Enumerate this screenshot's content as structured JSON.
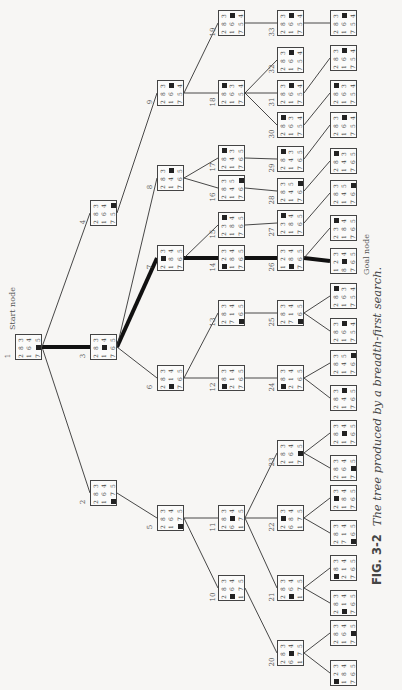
{
  "figure": {
    "label": "FIG. 3-2",
    "caption": "The tree produced by a breadth-first search.",
    "orientation": "rotated 90° counter-clockwise",
    "start_label": "Start node",
    "goal_label": "Goal node"
  },
  "nodes": [
    {
      "id": "1",
      "label": "1",
      "x": 15,
      "y": 334,
      "grid": "283164705",
      "role": "start"
    },
    {
      "id": "2",
      "label": "2",
      "x": 90,
      "y": 480,
      "grid": "283164075"
    },
    {
      "id": "3",
      "label": "3",
      "x": 90,
      "y": 334,
      "grid": "283104765"
    },
    {
      "id": "4",
      "label": "4",
      "x": 90,
      "y": 200,
      "grid": "283164750"
    },
    {
      "id": "5",
      "label": "5",
      "x": 157,
      "y": 505,
      "grid": "283164075"
    },
    {
      "id": "6",
      "label": "6",
      "x": 157,
      "y": 365,
      "grid": "283014765"
    },
    {
      "id": "7",
      "label": "7",
      "x": 157,
      "y": 245,
      "grid": "203184765"
    },
    {
      "id": "8",
      "label": "8",
      "x": 157,
      "y": 165,
      "grid": "283140765"
    },
    {
      "id": "9",
      "label": "9",
      "x": 157,
      "y": 80,
      "grid": "283160754"
    },
    {
      "id": "10",
      "label": "10",
      "x": 218,
      "y": 575,
      "grid": "283064175"
    },
    {
      "id": "11",
      "label": "11",
      "x": 218,
      "y": 505,
      "grid": "283604175"
    },
    {
      "id": "12",
      "label": "12",
      "x": 218,
      "y": 365,
      "grid": "083214765"
    },
    {
      "id": "13",
      "label": "13",
      "x": 218,
      "y": 300,
      "grid": "283714065"
    },
    {
      "id": "14",
      "label": "14",
      "x": 218,
      "y": 245,
      "grid": "023184765"
    },
    {
      "id": "15",
      "label": "15",
      "x": 218,
      "y": 212,
      "grid": "230184765"
    },
    {
      "id": "16",
      "label": "16",
      "x": 218,
      "y": 175,
      "grid": "283145760"
    },
    {
      "id": "17",
      "label": "17",
      "x": 218,
      "y": 145,
      "grid": "280143765"
    },
    {
      "id": "18",
      "label": "18",
      "x": 218,
      "y": 80,
      "grid": "280163754"
    },
    {
      "id": "19",
      "label": "19",
      "x": 218,
      "y": 10,
      "grid": "283160754"
    },
    {
      "id": "20",
      "label": "20",
      "x": 277,
      "y": 640,
      "grid": "283604175"
    },
    {
      "id": "21",
      "label": "21",
      "x": 277,
      "y": 575,
      "grid": "283064175"
    },
    {
      "id": "22",
      "label": "22",
      "x": 277,
      "y": 505,
      "grid": "203684175"
    },
    {
      "id": "23",
      "label": "23",
      "x": 277,
      "y": 440,
      "grid": "283164705"
    },
    {
      "id": "24",
      "label": "24",
      "x": 277,
      "y": 365,
      "grid": "083214765"
    },
    {
      "id": "25",
      "label": "25",
      "x": 277,
      "y": 300,
      "grid": "283714065"
    },
    {
      "id": "26",
      "label": "26",
      "x": 277,
      "y": 245,
      "grid": "123084765"
    },
    {
      "id": "27",
      "label": "27",
      "x": 277,
      "y": 210,
      "grid": "230184765"
    },
    {
      "id": "28",
      "label": "28",
      "x": 277,
      "y": 178,
      "grid": "283145760"
    },
    {
      "id": "29",
      "label": "29",
      "x": 277,
      "y": 146,
      "grid": "280143765"
    },
    {
      "id": "30",
      "label": "30",
      "x": 277,
      "y": 112,
      "grid": "280163754"
    },
    {
      "id": "31",
      "label": "31",
      "x": 277,
      "y": 80,
      "grid": "283160754"
    },
    {
      "id": "32",
      "label": "32",
      "x": 277,
      "y": 47,
      "grid": "283160754"
    },
    {
      "id": "33",
      "label": "33",
      "x": 277,
      "y": 10,
      "grid": "283160754"
    },
    {
      "id": "g1",
      "label": "",
      "x": 330,
      "y": 660,
      "grid": "023184765"
    },
    {
      "id": "g2",
      "label": "",
      "x": 330,
      "y": 620,
      "grid": "283164705"
    },
    {
      "id": "g3",
      "label": "",
      "x": 330,
      "y": 590,
      "grid": "283014765"
    },
    {
      "id": "g4",
      "label": "",
      "x": 330,
      "y": 555,
      "grid": "083214765"
    },
    {
      "id": "g5",
      "label": "",
      "x": 330,
      "y": 520,
      "grid": "283714065"
    },
    {
      "id": "g6",
      "label": "",
      "x": 330,
      "y": 485,
      "grid": "203184765"
    },
    {
      "id": "g7",
      "label": "",
      "x": 330,
      "y": 455,
      "grid": "283164705"
    },
    {
      "id": "g8",
      "label": "",
      "x": 330,
      "y": 420,
      "grid": "283104765"
    },
    {
      "id": "g9",
      "label": "",
      "x": 330,
      "y": 385,
      "grid": "283140765"
    },
    {
      "id": "g10",
      "label": "",
      "x": 330,
      "y": 350,
      "grid": "283145760"
    },
    {
      "id": "g11",
      "label": "",
      "x": 330,
      "y": 318,
      "grid": "283160754"
    },
    {
      "id": "g12",
      "label": "",
      "x": 330,
      "y": 283,
      "grid": "280163754"
    },
    {
      "id": "goal",
      "label": "",
      "x": 330,
      "y": 248,
      "grid": "123804765",
      "role": "goal"
    },
    {
      "id": "g14",
      "label": "",
      "x": 330,
      "y": 215,
      "grid": "230184765"
    },
    {
      "id": "g15",
      "label": "",
      "x": 330,
      "y": 180,
      "grid": "283145760"
    },
    {
      "id": "g16",
      "label": "",
      "x": 330,
      "y": 148,
      "grid": "280143765"
    },
    {
      "id": "g17",
      "label": "",
      "x": 330,
      "y": 112,
      "grid": "283160754"
    },
    {
      "id": "g18",
      "label": "",
      "x": 330,
      "y": 80,
      "grid": "280163754"
    },
    {
      "id": "g19",
      "label": "",
      "x": 330,
      "y": 45,
      "grid": "283160754"
    },
    {
      "id": "g20",
      "label": "",
      "x": 330,
      "y": 10,
      "grid": "283160754"
    }
  ],
  "edges": [
    [
      "1",
      "2"
    ],
    [
      "1",
      "3",
      true
    ],
    [
      "1",
      "4"
    ],
    [
      "2",
      "5"
    ],
    [
      "3",
      "6"
    ],
    [
      "3",
      "7",
      true
    ],
    [
      "3",
      "8"
    ],
    [
      "4",
      "9"
    ],
    [
      "5",
      "10"
    ],
    [
      "5",
      "11"
    ],
    [
      "6",
      "12"
    ],
    [
      "6",
      "13"
    ],
    [
      "7",
      "14",
      true
    ],
    [
      "7",
      "15"
    ],
    [
      "8",
      "16"
    ],
    [
      "8",
      "17"
    ],
    [
      "9",
      "18"
    ],
    [
      "9",
      "19"
    ],
    [
      "10",
      "20"
    ],
    [
      "11",
      "21"
    ],
    [
      "11",
      "22"
    ],
    [
      "11",
      "23"
    ],
    [
      "12",
      "24"
    ],
    [
      "13",
      "25"
    ],
    [
      "14",
      "26",
      true
    ],
    [
      "15",
      "27"
    ],
    [
      "16",
      "28"
    ],
    [
      "17",
      "29"
    ],
    [
      "18",
      "30"
    ],
    [
      "18",
      "31"
    ],
    [
      "18",
      "32"
    ],
    [
      "19",
      "33"
    ],
    [
      "20",
      "g1"
    ],
    [
      "20",
      "g2"
    ],
    [
      "21",
      "g3"
    ],
    [
      "21",
      "g4"
    ],
    [
      "22",
      "g5"
    ],
    [
      "22",
      "g6"
    ],
    [
      "23",
      "g7"
    ],
    [
      "23",
      "g8"
    ],
    [
      "24",
      "g9"
    ],
    [
      "24",
      "g10"
    ],
    [
      "25",
      "g11"
    ],
    [
      "25",
      "g12"
    ],
    [
      "26",
      "goal",
      true
    ],
    [
      "26",
      "g14"
    ],
    [
      "27",
      "g15"
    ],
    [
      "28",
      "g16"
    ],
    [
      "29",
      "g17"
    ],
    [
      "30",
      "g18"
    ],
    [
      "31",
      "g19"
    ],
    [
      "33",
      "g20"
    ]
  ]
}
